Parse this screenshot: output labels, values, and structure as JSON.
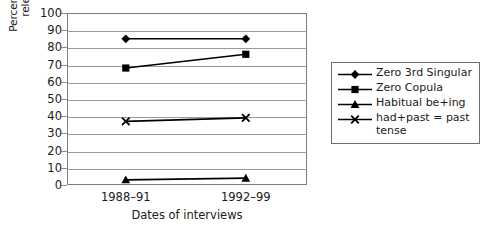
{
  "chart_data": {
    "type": "line",
    "title": "",
    "xlabel": "Dates of interviews",
    "ylabel_line1": "Percentage of tokens in the",
    "ylabel_line2": "relevant environment",
    "categories": [
      "1988–91",
      "1992–99"
    ],
    "yticks": [
      "100",
      "90",
      "80",
      "70",
      "60",
      "50",
      "40",
      "30",
      "20",
      "10",
      "0"
    ],
    "ylim": [
      0,
      100
    ],
    "grid": true,
    "legend_position": "right",
    "series": [
      {
        "name": "Zero 3rd Singular",
        "marker": "diamond",
        "values": [
          85,
          85
        ],
        "color": "#000000"
      },
      {
        "name": "Zero Copula",
        "marker": "square",
        "values": [
          68,
          76
        ],
        "color": "#000000"
      },
      {
        "name": "Habitual be+ing",
        "marker": "triangle",
        "values": [
          3,
          4
        ],
        "color": "#000000"
      },
      {
        "name": "had+past = past tense",
        "name_line1": "had+past = past",
        "name_line2": "tense",
        "marker": "cross",
        "values": [
          37,
          39
        ],
        "color": "#000000"
      }
    ]
  }
}
